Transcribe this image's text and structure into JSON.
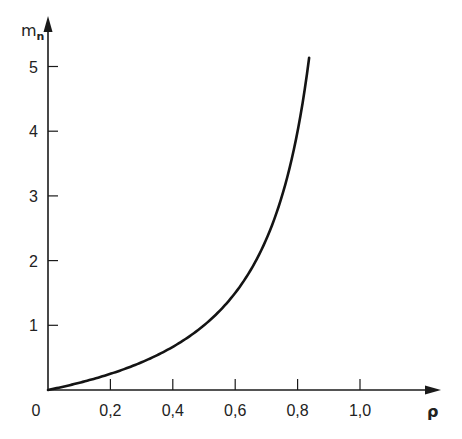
{
  "chart_data": {
    "type": "line",
    "title": "",
    "xlabel": "ρ",
    "ylabel": "m",
    "ylabel_subscript": "n",
    "xlim": [
      0,
      1.2
    ],
    "ylim": [
      0,
      5.3
    ],
    "grid": false,
    "legend": null,
    "origin_label": "0",
    "x_ticks": [
      0.2,
      0.4,
      0.6,
      0.8,
      1.0
    ],
    "x_tick_labels": [
      "0,2",
      "0,4",
      "0,6",
      "0,8",
      "1,0"
    ],
    "y_ticks": [
      1,
      2,
      3,
      4,
      5
    ],
    "y_tick_labels": [
      "1",
      "2",
      "3",
      "4",
      "5"
    ],
    "series": [
      {
        "name": "m_n",
        "formula": "m = ρ/(1-ρ)",
        "x": [
          0.0,
          0.1,
          0.2,
          0.3,
          0.4,
          0.5,
          0.55,
          0.6,
          0.65,
          0.7,
          0.75,
          0.78,
          0.8,
          0.82,
          0.837
        ],
        "y": [
          0.0,
          0.11,
          0.25,
          0.43,
          0.67,
          1.0,
          1.22,
          1.5,
          1.86,
          2.33,
          3.0,
          3.55,
          4.0,
          4.56,
          5.13
        ]
      }
    ]
  },
  "axes": {
    "x_title": "ρ",
    "y_title": "m",
    "y_title_sub": "n",
    "origin": "0"
  }
}
